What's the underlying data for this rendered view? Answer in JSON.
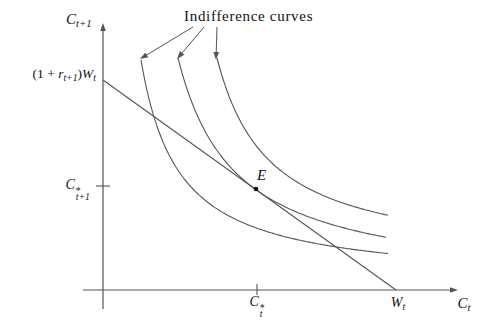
{
  "colors": {
    "background": "#ffffff",
    "line": "#555555",
    "text": "#111111"
  },
  "labels": {
    "title": "Indifference curves",
    "y_axis_var": {
      "base": "C",
      "sub": "t+1"
    },
    "x_axis_var": {
      "base": "C",
      "sub": "t"
    },
    "endowment": {
      "open": "(1 + ",
      "r": "r",
      "r_sub": "t+1",
      "close": ")",
      "w": "W",
      "w_sub": "t"
    },
    "c_star_t1": {
      "base": "C",
      "sup": "*",
      "sub": "t+1"
    },
    "c_star_t": {
      "base": "C",
      "sup": "*",
      "sub": "t"
    },
    "w_t": {
      "base": "W",
      "sub": "t"
    },
    "equilibrium": "E"
  },
  "chart_data": {
    "type": "line",
    "title": "Indifference curves",
    "x_axis_label": "C_t",
    "y_axis_label": "C_t+1",
    "grid": false,
    "origin_px": [
      103,
      290
    ],
    "y_axis": {
      "from_px": [
        103,
        309
      ],
      "to_px": [
        103,
        23
      ]
    },
    "x_axis": {
      "from_px": [
        83,
        290
      ],
      "to_px": [
        458,
        290
      ]
    },
    "budget_line": {
      "from_px": [
        103,
        80
      ],
      "to_px": [
        396,
        290
      ],
      "y_intercept_label": "(1 + r_t+1)W_t",
      "x_intercept_label": "W_t"
    },
    "equilibrium": {
      "label": "E",
      "px": [
        256,
        189
      ],
      "x_value_label": "C*_t",
      "y_value_label": "C*_t+1"
    },
    "ticks": [
      {
        "name": "tick-c-star-t1",
        "from_px": [
          96,
          186
        ],
        "to_px": [
          110,
          186
        ]
      },
      {
        "name": "tick-c-star-t",
        "from_px": [
          257,
          284
        ],
        "to_px": [
          257,
          295
        ]
      }
    ],
    "indifference_curves": [
      {
        "name": "indifference-curve-1",
        "k": 8484,
        "a": 0,
        "b": 6.7,
        "x_start_px": 141,
        "x_end_px": 388
      },
      {
        "name": "indifference-curve-2",
        "k": 13160,
        "a": 17.5,
        "b": 3.2,
        "x_start_px": 178,
        "x_end_px": 386
      },
      {
        "name": "indifference-curve-3",
        "k": 10840,
        "a": 61.3,
        "b": 26.3,
        "x_start_px": 217,
        "x_end_px": 388
      }
    ],
    "annotation_arrows": [
      {
        "from_px": [
          193,
          27
        ],
        "to_px": [
          140,
          59
        ]
      },
      {
        "from_px": [
          204,
          27
        ],
        "to_px": [
          177,
          59
        ]
      },
      {
        "from_px": [
          217,
          27
        ],
        "to_px": [
          216,
          60
        ]
      }
    ]
  }
}
